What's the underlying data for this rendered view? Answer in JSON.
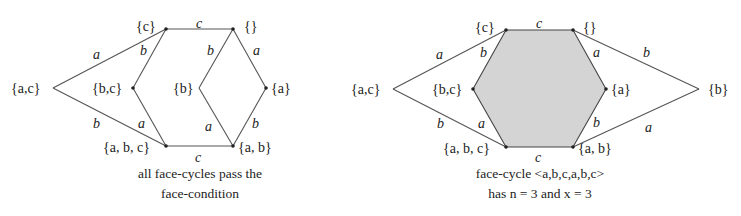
{
  "left_diagram": {
    "vertices": {
      "ac": "{a,c}",
      "c": "{c}",
      "empty": "{}",
      "bc": "{b,c}",
      "b": "{b}",
      "a": "{a}",
      "abc": "{a, b, c}",
      "ab": "{a, b}"
    },
    "edges": {
      "ac_c": "a",
      "ac_abc": "b",
      "c_empty": "c",
      "c_bc": "b",
      "bc_abc": "a",
      "empty_b": "b",
      "empty_a": "a",
      "b_ab": "a",
      "a_ab": "b",
      "abc_ab": "c"
    },
    "caption": [
      "all face-cycles pass the",
      "face-condition"
    ]
  },
  "right_diagram": {
    "vertices": {
      "ac": "{a,c}",
      "c": "{c}",
      "empty": "{}",
      "bc": "{b,c}",
      "a": "{a}",
      "b": "{b}",
      "abc": "{a, b, c}",
      "ab": "{a, b}"
    },
    "edges": {
      "ac_c": "a",
      "ac_abc": "b",
      "c_empty": "c",
      "c_bc": "b",
      "bc_abc": "a",
      "empty_a": "a",
      "empty_b": "b",
      "a_ab": "b",
      "b_ab": "a",
      "abc_ab": "c"
    },
    "caption": [
      "face-cycle <a,b,c,a,b,c>",
      "has n = 3 and x = 3"
    ],
    "highlighted_face": "<a,b,c,a,b,c>",
    "face_color": "#d4d4d4"
  }
}
